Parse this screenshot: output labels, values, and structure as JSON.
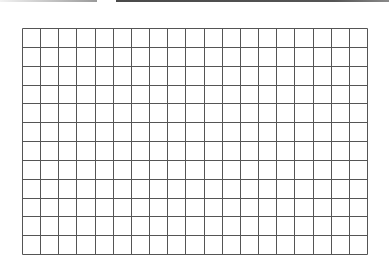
{
  "top_bars": {
    "left": {
      "from_color": "#f2f2f2",
      "to_color": "#9a9a9a"
    },
    "right": {
      "color": "#4a4a4a"
    }
  },
  "grid": {
    "columns": 19,
    "rows": 12,
    "left": 22,
    "top": 28,
    "width": 345,
    "height": 226,
    "line_color": "#555555",
    "background": "#ffffff"
  }
}
